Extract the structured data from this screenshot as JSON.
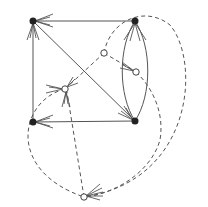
{
  "diagram": {
    "type": "directed-graph",
    "colors": {
      "edge": "#555555",
      "black_node": "#222222",
      "white_node": "#ffffff"
    },
    "nodes": [
      {
        "id": "TL",
        "kind": "black",
        "x": 33,
        "y": 21
      },
      {
        "id": "TR",
        "kind": "black",
        "x": 135,
        "y": 21
      },
      {
        "id": "BL",
        "kind": "black",
        "x": 33,
        "y": 122
      },
      {
        "id": "BR",
        "kind": "black",
        "x": 135,
        "y": 121
      },
      {
        "id": "A",
        "kind": "white",
        "x": 104,
        "y": 53
      },
      {
        "id": "B",
        "kind": "white",
        "x": 136,
        "y": 72
      },
      {
        "id": "C",
        "kind": "white",
        "x": 65,
        "y": 89
      },
      {
        "id": "D",
        "kind": "white",
        "x": 84,
        "y": 197
      }
    ],
    "edges": [
      {
        "from": "TR",
        "to": "TL",
        "style": "solid"
      },
      {
        "from": "BL",
        "to": "TL",
        "style": "solid"
      },
      {
        "from": "TL",
        "to": "BR",
        "style": "solid"
      },
      {
        "from": "BR",
        "to": "BL",
        "style": "solid"
      },
      {
        "from": "BR",
        "to": "TR",
        "style": "solid",
        "curve": "left"
      },
      {
        "from": "BR",
        "to": "TR",
        "style": "solid",
        "curve": "right"
      },
      {
        "from": "A",
        "to": "C",
        "style": "dashed"
      },
      {
        "from": "A",
        "to": "B",
        "style": "dashed"
      },
      {
        "from": "D",
        "to": "C",
        "style": "dashed"
      },
      {
        "from": "C",
        "to": "D",
        "style": "dashed",
        "curve": "left"
      },
      {
        "from": "A",
        "to": "D",
        "style": "dashed",
        "curve": "around-right"
      },
      {
        "from": "B",
        "to": "D",
        "style": "dashed",
        "curve": "around-right"
      }
    ]
  }
}
